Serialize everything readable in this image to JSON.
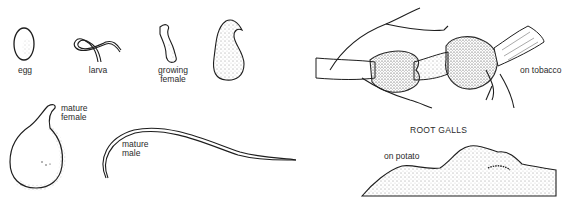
{
  "figure": {
    "stages": [
      {
        "id": "egg",
        "label": "egg"
      },
      {
        "id": "larva",
        "label": "larva"
      },
      {
        "id": "growing_female",
        "label": "growing\nfemale"
      },
      {
        "id": "swollen_female",
        "label": ""
      },
      {
        "id": "mature_female",
        "label": "mature\nfemale"
      },
      {
        "id": "mature_male",
        "label": "mature\nmale"
      }
    ],
    "galls": {
      "title": "ROOT GALLS",
      "tobacco_label": "on tobacco",
      "potato_label": "on potato"
    },
    "colors": {
      "ink": "#1e1e1e",
      "background": "#ffffff"
    }
  }
}
